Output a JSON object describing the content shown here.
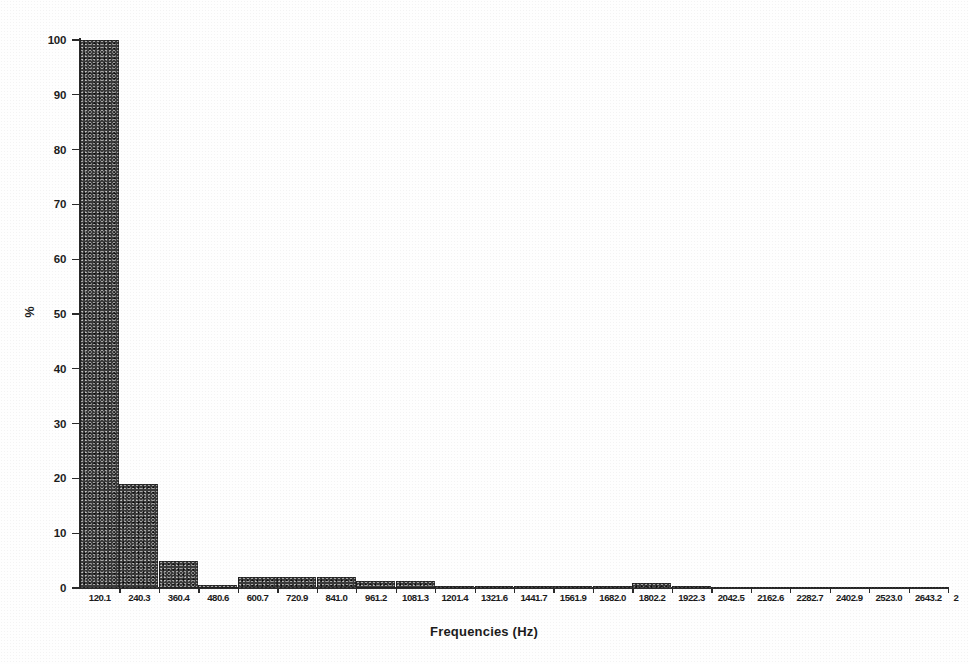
{
  "chart_data": {
    "type": "bar",
    "title": "",
    "xlabel": "Frequencies (Hz)",
    "ylabel": "%",
    "ylim": [
      0,
      100
    ],
    "ytick_values": [
      0,
      10,
      20,
      30,
      40,
      50,
      60,
      70,
      80,
      90,
      100
    ],
    "ytick_labels": [
      "0",
      "10",
      "20",
      "30",
      "40",
      "50",
      "60",
      "70",
      "80",
      "90",
      "100"
    ],
    "grid": false,
    "legend": null,
    "categories": [
      "120.1",
      "240.3",
      "360.4",
      "480.6",
      "600.7",
      "720.9",
      "841.0",
      "961.2",
      "1081.3",
      "1201.4",
      "1321.6",
      "1441.7",
      "1561.9",
      "1682.0",
      "1802.2",
      "1922.3",
      "2042.5",
      "2162.6",
      "2282.7",
      "2402.9",
      "2523.0",
      "2643.2"
    ],
    "values": [
      100,
      19,
      5,
      0.6,
      2,
      2,
      2,
      1.2,
      1.2,
      0.3,
      0.3,
      0.3,
      0.3,
      0.3,
      0.9,
      0.3,
      0.2,
      0.2,
      0.2,
      0.2,
      0.2,
      0.2
    ],
    "trailing_tick_label": "2",
    "bar_color": "#3a3a3a",
    "axis_color": "#2a2a2a"
  }
}
